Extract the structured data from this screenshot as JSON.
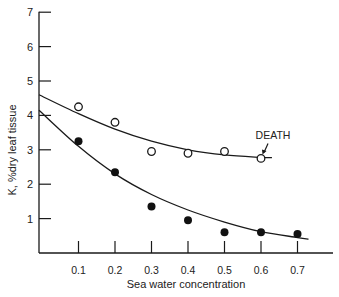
{
  "chart_data": {
    "type": "scatter",
    "title": "",
    "xlabel": "Sea water concentration",
    "ylabel": "K, %dry leaf tissue",
    "xlim": [
      0,
      0.75
    ],
    "ylim": [
      0,
      7
    ],
    "x_ticks": [
      "0.1",
      "0.2",
      "0.3",
      "0.4",
      "0.5",
      "0.6",
      "0.7"
    ],
    "x_tick_values": [
      0.1,
      0.2,
      0.3,
      0.4,
      0.5,
      0.6,
      0.7
    ],
    "y_ticks": [
      "1",
      "2",
      "3",
      "4",
      "5",
      "6",
      "7"
    ],
    "y_tick_values": [
      1,
      2,
      3,
      4,
      5,
      6,
      7
    ],
    "grid": false,
    "series": [
      {
        "name": "open-circles",
        "marker": "open-circle",
        "x": [
          0.1,
          0.2,
          0.3,
          0.4,
          0.5,
          0.6
        ],
        "values": [
          4.25,
          3.8,
          2.95,
          2.9,
          2.95,
          2.75
        ],
        "fit_curve": {
          "x": [
            0,
            0.1,
            0.2,
            0.3,
            0.4,
            0.5,
            0.6,
            0.63
          ],
          "values": [
            4.6,
            4.05,
            3.6,
            3.25,
            3.0,
            2.85,
            2.78,
            2.77
          ]
        }
      },
      {
        "name": "filled-circles",
        "marker": "filled-circle",
        "x": [
          0.1,
          0.2,
          0.3,
          0.4,
          0.5,
          0.6,
          0.7
        ],
        "values": [
          3.25,
          2.35,
          1.35,
          0.95,
          0.6,
          0.6,
          0.55
        ],
        "fit_curve": {
          "x": [
            0,
            0.1,
            0.2,
            0.3,
            0.4,
            0.5,
            0.6,
            0.7,
            0.73
          ],
          "values": [
            4.15,
            3.1,
            2.3,
            1.7,
            1.25,
            0.9,
            0.62,
            0.45,
            0.4
          ]
        }
      }
    ],
    "annotations": [
      {
        "text": "DEATH",
        "x": 0.6,
        "y": 2.75,
        "arrow": true
      }
    ]
  }
}
